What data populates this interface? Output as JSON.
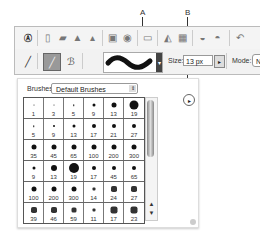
{
  "callouts": {
    "a": "A",
    "b": "B"
  },
  "toolbar_top": {
    "icons": [
      "adobe-logo-icon",
      "new-document-icon",
      "open-folder-icon",
      "browse-icon",
      "scan-icon",
      "save-icon",
      "save-for-web-icon",
      "delete-icon",
      "print-icon",
      "print-preview-icon",
      "email-icon",
      "email-attachment-icon",
      "undo-icon"
    ]
  },
  "options_bar": {
    "tool_icons": [
      "brush-tool-icon",
      "brush-preset-icon",
      "impressionist-brush-icon"
    ],
    "brush_preview": "brush-stroke-preview",
    "size_label": "Size:",
    "size_value": "13 px",
    "mode_label": "Mode:",
    "mode_value": "Nor"
  },
  "brushes_panel": {
    "label": "Brushes:",
    "selected_set": "Default Brushes",
    "rows": [
      [
        {
          "size": "1",
          "dot": 1
        },
        {
          "size": "3",
          "dot": 1
        },
        {
          "size": "5",
          "dot": 1.5
        },
        {
          "size": "9",
          "dot": 3
        },
        {
          "size": "13",
          "dot": 5
        },
        {
          "size": "19",
          "dot": 9
        }
      ],
      [
        {
          "size": "5",
          "dot": 1.5
        },
        {
          "size": "9",
          "dot": 2
        },
        {
          "size": "13",
          "dot": 3
        },
        {
          "size": "17",
          "dot": 4
        },
        {
          "size": "21",
          "dot": 4
        },
        {
          "size": "27",
          "dot": 4
        }
      ],
      [
        {
          "size": "35",
          "dot": 5
        },
        {
          "size": "45",
          "dot": 5
        },
        {
          "size": "65",
          "dot": 5
        },
        {
          "size": "100",
          "dot": 5
        },
        {
          "size": "200",
          "dot": 5
        },
        {
          "size": "300",
          "dot": 5
        }
      ],
      [
        {
          "size": "9",
          "dot": 3
        },
        {
          "size": "13",
          "dot": 6
        },
        {
          "size": "19",
          "dot": 10
        },
        {
          "size": "17",
          "dot": 4
        },
        {
          "size": "45",
          "dot": 4
        },
        {
          "size": "65",
          "dot": 4
        }
      ],
      [
        {
          "size": "100",
          "dot": 5
        },
        {
          "size": "200",
          "dot": 5
        },
        {
          "size": "300",
          "dot": 5
        },
        {
          "size": "14",
          "dot": 3
        },
        {
          "size": "24",
          "dot": 6
        },
        {
          "size": "27",
          "dot": 6
        }
      ],
      [
        {
          "size": "39",
          "dot": 6
        },
        {
          "size": "46",
          "dot": 6
        },
        {
          "size": "59",
          "dot": 5
        },
        {
          "size": "11",
          "dot": 3
        },
        {
          "size": "17",
          "dot": 7
        },
        {
          "size": "23",
          "dot": 7
        }
      ]
    ],
    "menu_icon": "panel-menu-arrow-icon"
  }
}
